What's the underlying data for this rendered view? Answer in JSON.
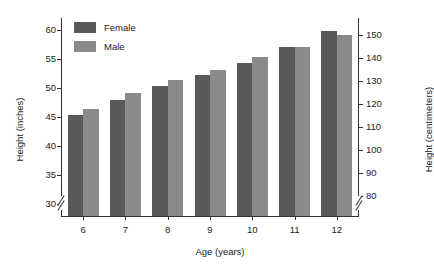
{
  "chart_data": {
    "type": "bar",
    "title": "",
    "subtitle": "",
    "xlabel": "Age (years)",
    "ylabel": "Height (inches)",
    "ylabel_secondary": "Height (centimeters)",
    "categories": [
      "6",
      "7",
      "8",
      "9",
      "10",
      "11",
      "12"
    ],
    "series": [
      {
        "name": "Female",
        "color": "#595959",
        "values": [
          45.4,
          48.0,
          50.4,
          52.3,
          54.3,
          57.0,
          59.7
        ]
      },
      {
        "name": "Male",
        "color": "#8a8a8a",
        "values": [
          46.3,
          49.1,
          51.4,
          53.1,
          55.3,
          57.0,
          59.0
        ]
      }
    ],
    "units_primary": "inches",
    "units_secondary": "centimeters",
    "ylim": [
      28,
      62
    ],
    "yticks": [
      30,
      35,
      40,
      45,
      50,
      55,
      60
    ],
    "yticks_secondary": [
      80,
      90,
      100,
      110,
      120,
      130,
      140,
      150
    ],
    "ylim_secondary": [
      71.12,
      157.48
    ],
    "axis_break_left": true,
    "axis_break_right": true,
    "grid": false,
    "legend_position": "top-left",
    "legend": [
      "Female",
      "Male"
    ]
  },
  "legend": {
    "female_label": "Female",
    "male_label": "Male",
    "female_swatch": "female-color-swatch",
    "male_swatch": "male-color-swatch"
  },
  "axes": {
    "x_title": "Age (years)",
    "y_title_left": "Height (inches)",
    "y_title_right": "Height (centimeters)",
    "x_ticks": [
      "6",
      "7",
      "8",
      "9",
      "10",
      "11",
      "12"
    ],
    "y_ticks_left": [
      "30",
      "35",
      "40",
      "45",
      "50",
      "55",
      "60"
    ],
    "y_ticks_right": [
      "80",
      "90",
      "100",
      "110",
      "120",
      "130",
      "140",
      "150"
    ]
  }
}
